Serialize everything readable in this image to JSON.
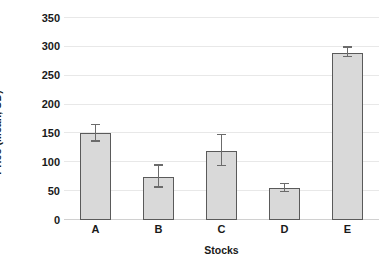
{
  "chart_data": {
    "type": "bar",
    "title": "",
    "xlabel": "Stocks",
    "ylabel": "Price (Mean, SD)",
    "categories": [
      "A",
      "B",
      "C",
      "D",
      "E"
    ],
    "values": [
      150,
      75,
      120,
      55,
      290
    ],
    "errors": [
      14,
      19,
      27,
      7,
      8
    ],
    "ylim": [
      0,
      350
    ],
    "ytick_labels": [
      "0",
      "50",
      "100",
      "150",
      "200",
      "250",
      "300",
      "350"
    ],
    "ytick_values": [
      0,
      50,
      100,
      150,
      200,
      250,
      300,
      350
    ],
    "grid": true,
    "legend": "none",
    "error_type": "SD",
    "colors": {
      "bar_fill": "#d9d9d9",
      "bar_border": "#5a5a5a",
      "errorbar": "#6b6b6b",
      "gridline": "#e8e8e8",
      "axis": "#d0d0d0",
      "text": "#1a1a1a",
      "background": "#ffffff"
    }
  }
}
